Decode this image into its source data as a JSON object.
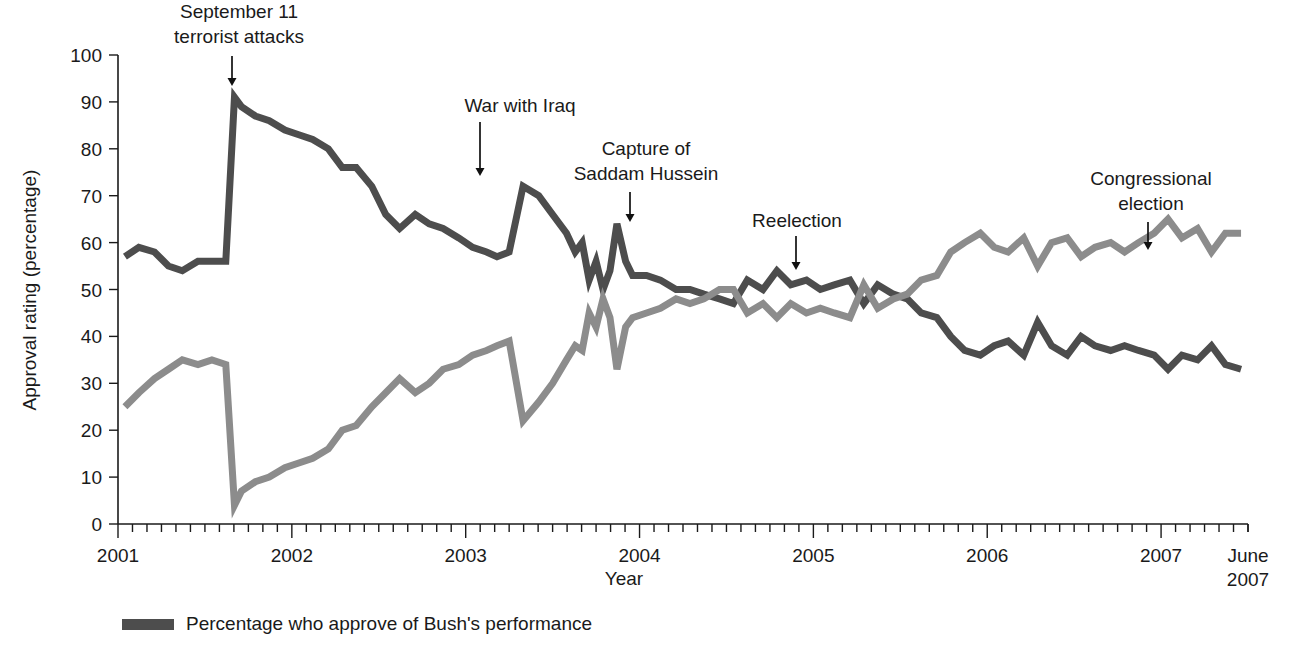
{
  "chart_data": {
    "type": "line",
    "title": "",
    "xlabel": "Year",
    "ylabel": "Approval rating (percentage)",
    "ylim": [
      0,
      100
    ],
    "ytick_step": 10,
    "yticks": [
      "0",
      "10",
      "20",
      "30",
      "40",
      "50",
      "60",
      "70",
      "80",
      "90",
      "100"
    ],
    "xlim": [
      2001.0,
      2007.5
    ],
    "xticks": [
      "2001",
      "2002",
      "2003",
      "2004",
      "2005",
      "2006",
      "2007"
    ],
    "x_end_label_line1": "June",
    "x_end_label_line2": "2007",
    "minor_ticks": "monthly",
    "grid": false,
    "legend_position": "bottom-left",
    "x": [
      2001.04,
      2001.12,
      2001.21,
      2001.29,
      2001.37,
      2001.46,
      2001.54,
      2001.62,
      2001.67,
      2001.71,
      2001.79,
      2001.87,
      2001.96,
      2002.04,
      2002.12,
      2002.21,
      2002.29,
      2002.37,
      2002.46,
      2002.54,
      2002.62,
      2002.71,
      2002.79,
      2002.87,
      2002.96,
      2003.04,
      2003.12,
      2003.18,
      2003.25,
      2003.33,
      2003.42,
      2003.5,
      2003.58,
      2003.63,
      2003.67,
      2003.71,
      2003.75,
      2003.79,
      2003.83,
      2003.87,
      2003.92,
      2003.96,
      2004.04,
      2004.12,
      2004.21,
      2004.29,
      2004.37,
      2004.46,
      2004.54,
      2004.62,
      2004.71,
      2004.79,
      2004.87,
      2004.96,
      2005.04,
      2005.12,
      2005.21,
      2005.29,
      2005.37,
      2005.46,
      2005.54,
      2005.62,
      2005.71,
      2005.79,
      2005.87,
      2005.96,
      2006.04,
      2006.12,
      2006.21,
      2006.29,
      2006.37,
      2006.46,
      2006.54,
      2006.62,
      2006.71,
      2006.79,
      2006.87,
      2006.96,
      2007.04,
      2007.12,
      2007.21,
      2007.29,
      2007.37,
      2007.46
    ],
    "series": [
      {
        "name": "Percentage who approve of Bush's performance",
        "color": "#4d4d4d",
        "values": [
          57,
          59,
          58,
          55,
          54,
          56,
          56,
          56,
          91,
          89,
          87,
          86,
          84,
          83,
          82,
          80,
          76,
          76,
          72,
          66,
          63,
          66,
          64,
          63,
          61,
          59,
          58,
          57,
          58,
          72,
          70,
          66,
          62,
          58,
          60,
          52,
          56,
          50,
          54,
          64,
          56,
          53,
          53,
          52,
          50,
          50,
          49,
          48,
          47,
          52,
          50,
          54,
          51,
          52,
          50,
          51,
          52,
          47,
          51,
          49,
          48,
          45,
          44,
          40,
          37,
          36,
          38,
          39,
          36,
          43,
          38,
          36,
          40,
          38,
          37,
          38,
          37,
          36,
          33,
          36,
          35,
          38,
          34,
          33
        ]
      },
      {
        "name": "Percentage who disapprove of Bush's performance",
        "color": "#8c8c8c",
        "values": [
          25,
          28,
          31,
          33,
          35,
          34,
          35,
          34,
          4,
          7,
          9,
          10,
          12,
          13,
          14,
          16,
          20,
          21,
          25,
          28,
          31,
          28,
          30,
          33,
          34,
          36,
          37,
          38,
          39,
          22,
          26,
          30,
          35,
          38,
          37,
          45,
          42,
          48,
          44,
          33,
          42,
          44,
          45,
          46,
          48,
          47,
          48,
          50,
          50,
          45,
          47,
          44,
          47,
          45,
          46,
          45,
          44,
          51,
          46,
          48,
          49,
          52,
          53,
          58,
          60,
          62,
          59,
          58,
          61,
          55,
          60,
          61,
          57,
          59,
          60,
          58,
          60,
          62,
          65,
          61,
          63,
          58,
          62,
          62
        ]
      }
    ],
    "annotations": [
      {
        "name": "september-11-attacks",
        "lines": [
          "September 11",
          "terrorist attacks"
        ],
        "x": 2001.67,
        "text_anchor": "middle",
        "label_x": 239,
        "label_y": 18,
        "arrow_x": 232,
        "arrow_top": 56,
        "arrow_bottom": 86
      },
      {
        "name": "war-with-iraq",
        "lines": [
          "War with Iraq"
        ],
        "x": 2003.33,
        "text_anchor": "middle",
        "label_x": 520,
        "label_y": 112,
        "arrow_x": 480,
        "arrow_top": 122,
        "arrow_bottom": 176
      },
      {
        "name": "capture-of-saddam-hussein",
        "lines": [
          "Capture of",
          "Saddam Hussein"
        ],
        "x": 2003.92,
        "text_anchor": "middle",
        "label_x": 646,
        "label_y": 155,
        "arrow_x": 630,
        "arrow_top": 192,
        "arrow_bottom": 222
      },
      {
        "name": "reelection",
        "lines": [
          "Reelection"
        ],
        "x": 2004.79,
        "text_anchor": "middle",
        "label_x": 797,
        "label_y": 227,
        "arrow_x": 796,
        "arrow_top": 236,
        "arrow_bottom": 270
      },
      {
        "name": "congressional-election",
        "lines": [
          "Congressional",
          "election"
        ],
        "x": 2006.83,
        "text_anchor": "middle",
        "label_x": 1151,
        "label_y": 185,
        "arrow_x": 1148,
        "arrow_top": 222,
        "arrow_bottom": 250
      }
    ],
    "legend": [
      {
        "name": "approve",
        "label": "Percentage who approve of Bush's performance",
        "color": "#4d4d4d"
      }
    ]
  }
}
